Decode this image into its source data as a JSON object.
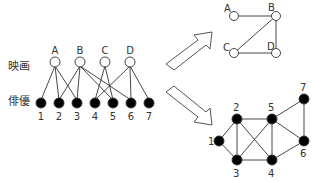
{
  "labels": {
    "movies_row": "映画",
    "actors_row": "俳優"
  },
  "colors": {
    "movie_fill": "#ffffff",
    "actor_fill": "#000000",
    "edge": "#333333",
    "arrow": "#555555"
  },
  "bipartite": {
    "movies": [
      "A",
      "B",
      "C",
      "D"
    ],
    "actors": [
      "1",
      "2",
      "3",
      "4",
      "5",
      "6",
      "7"
    ],
    "edges": [
      [
        "A",
        "1"
      ],
      [
        "A",
        "2"
      ],
      [
        "A",
        "3"
      ],
      [
        "B",
        "2"
      ],
      [
        "B",
        "3"
      ],
      [
        "B",
        "5"
      ],
      [
        "B",
        "6"
      ],
      [
        "C",
        "4"
      ],
      [
        "C",
        "5"
      ],
      [
        "D",
        "4"
      ],
      [
        "D",
        "6"
      ],
      [
        "D",
        "7"
      ]
    ]
  },
  "movie_projection": {
    "nodes": [
      "A",
      "B",
      "C",
      "D"
    ],
    "edges": [
      [
        "A",
        "B"
      ],
      [
        "B",
        "C"
      ],
      [
        "B",
        "D"
      ],
      [
        "C",
        "D"
      ]
    ]
  },
  "actor_projection": {
    "nodes": [
      "1",
      "2",
      "3",
      "4",
      "5",
      "6",
      "7"
    ],
    "edges": [
      [
        "1",
        "2"
      ],
      [
        "1",
        "3"
      ],
      [
        "2",
        "3"
      ],
      [
        "2",
        "5"
      ],
      [
        "2",
        "4"
      ],
      [
        "3",
        "5"
      ],
      [
        "3",
        "4"
      ],
      [
        "4",
        "5"
      ],
      [
        "5",
        "6"
      ],
      [
        "5",
        "7"
      ],
      [
        "4",
        "6"
      ],
      [
        "6",
        "7"
      ]
    ]
  }
}
